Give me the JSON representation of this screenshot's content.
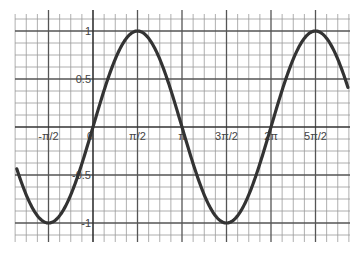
{
  "chart_data": {
    "type": "line",
    "title": "",
    "function": "y = sin(x)",
    "xlabel": "",
    "ylabel": "",
    "x_ticks": [
      {
        "value": -1.5708,
        "label": "-π/2"
      },
      {
        "value": 0,
        "label": "0"
      },
      {
        "value": 1.5708,
        "label": "π/2"
      },
      {
        "value": 3.1416,
        "label": "π"
      },
      {
        "value": 4.7124,
        "label": "3π/2"
      },
      {
        "value": 6.2832,
        "label": "2π"
      },
      {
        "value": 7.854,
        "label": "5π/2"
      }
    ],
    "y_ticks": [
      {
        "value": 1,
        "label": "1"
      },
      {
        "value": 0.5,
        "label": "0.5"
      },
      {
        "value": -0.5,
        "label": "-0.5"
      },
      {
        "value": -1,
        "label": "-1"
      }
    ],
    "xlim": [
      -2.75,
      9.0
    ],
    "ylim": [
      -1.125,
      1.125
    ],
    "grid": true,
    "minor_grid_x_step": "π/8",
    "minor_grid_y_step": 0.125,
    "series": [
      {
        "name": "sin(x)",
        "x": [
          -2.75,
          -1.5708,
          0,
          1.5708,
          3.1416,
          4.7124,
          6.2832,
          7.854,
          9.0
        ],
        "values": [
          -0.38,
          -1,
          0,
          1,
          0,
          -1,
          0,
          1,
          0.41
        ]
      }
    ],
    "legend": null
  },
  "colors": {
    "curve": "#333333",
    "axis": "#333333",
    "major_grid": "#555555",
    "minor_grid": "#9a9a9a",
    "background": "#ffffff"
  }
}
